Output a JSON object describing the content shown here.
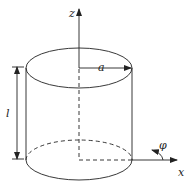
{
  "labels": {
    "z_axis": "z",
    "x_axis": "x",
    "radius": "a",
    "length": "l",
    "angle": "φ"
  },
  "colors": {
    "stroke": "#222222",
    "background": "#ffffff"
  }
}
